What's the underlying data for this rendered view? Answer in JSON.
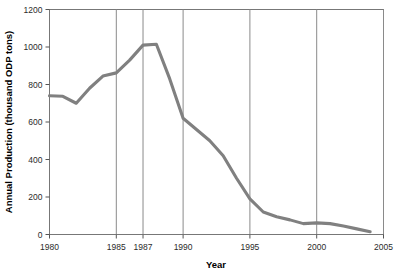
{
  "chart_data": {
    "type": "line",
    "title": "",
    "xlabel": "Year",
    "ylabel": "Annual Production (thousand ODP tons)",
    "xlim": [
      1980,
      2005
    ],
    "ylim": [
      0,
      1200
    ],
    "grid": "vertical gridlines at each labeled x tick",
    "legend": "none",
    "line_color": "#808080",
    "x_ticks": [
      1980,
      1985,
      1987,
      1990,
      1995,
      2000,
      2005
    ],
    "x_tick_labels": [
      "1980",
      "1985",
      "1987",
      "1990",
      "1995",
      "2000",
      "2005"
    ],
    "y_ticks": [
      0,
      200,
      400,
      600,
      800,
      1000,
      1200
    ],
    "y_tick_labels": [
      "0",
      "200",
      "400",
      "600",
      "800",
      "1000",
      "1200"
    ],
    "series": [
      {
        "name": "Annual Production",
        "x": [
          1980,
          1981,
          1982,
          1983,
          1984,
          1985,
          1986,
          1987,
          1988,
          1989,
          1990,
          1991,
          1992,
          1993,
          1994,
          1995,
          1996,
          1997,
          1998,
          1999,
          2000,
          2001,
          2002,
          2003,
          2004
        ],
        "values": [
          740,
          737,
          700,
          780,
          845,
          862,
          930,
          1010,
          1015,
          830,
          620,
          560,
          500,
          420,
          300,
          190,
          120,
          95,
          78,
          58,
          62,
          58,
          45,
          30,
          15
        ]
      }
    ]
  },
  "figure": {
    "axis_color": "#777777",
    "grid_color": "#8a8a8a",
    "text_color": "#2b2b2b",
    "background": "#ffffff"
  }
}
